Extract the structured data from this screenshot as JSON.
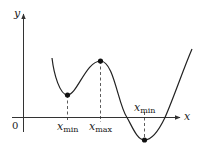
{
  "diagram": {
    "type": "function-graph",
    "axes": {
      "x_label": "x",
      "y_label": "y",
      "origin_label": "0"
    },
    "labels": [
      {
        "var": "x",
        "sub": "min"
      },
      {
        "var": "x",
        "sub": "max"
      },
      {
        "var": "x",
        "sub": "min"
      }
    ],
    "points": [
      {
        "name": "local-minimum",
        "label_index": 0
      },
      {
        "name": "local-maximum",
        "label_index": 1
      },
      {
        "name": "global-minimum",
        "label_index": 2
      }
    ],
    "colors": {
      "curve": "#222222",
      "axes": "#333333",
      "points": "#111111"
    }
  }
}
